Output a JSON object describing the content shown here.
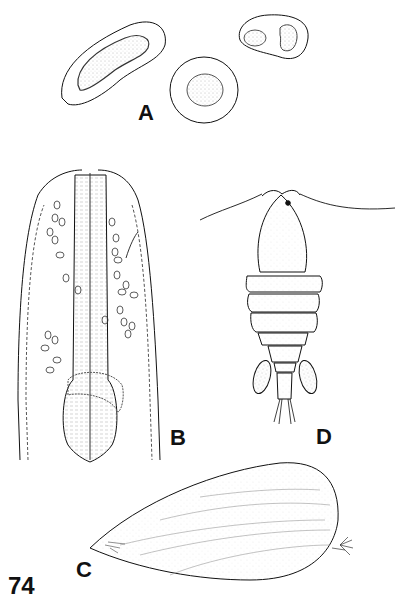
{
  "figure": {
    "number": "74",
    "panels": [
      {
        "id": "A",
        "label": "A",
        "subject": "cross-sections of cells / cysts with stippled nuclei"
      },
      {
        "id": "B",
        "label": "B",
        "subject": "anterior end of nematode-like worm with pharynx and scattered ovoid cells"
      },
      {
        "id": "C",
        "label": "C",
        "subject": "elongate bivalve-like shell / valve with striations and terminal setae"
      },
      {
        "id": "D",
        "label": "D",
        "subject": "copepod, dorsal view, with antennules, segmented body, egg sacs and caudal setae"
      }
    ]
  },
  "colors": {
    "ink": "#111111",
    "background": "#ffffff",
    "stipple": "#888888"
  }
}
